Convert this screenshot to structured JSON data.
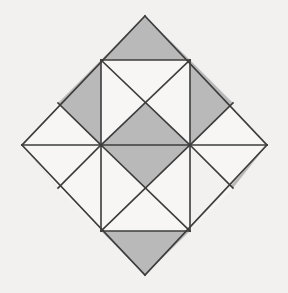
{
  "figure": {
    "type": "geometric-figure",
    "canvas": {
      "width": 288,
      "height": 293
    },
    "background_color": "#f2f1ef",
    "shaded_color": "#b9b9b9",
    "plain_color": "#f7f6f4",
    "stroke_color": "#3c3c3c",
    "stroke_width": 1.6,
    "outline_name": "diamond-outline",
    "vertices": {
      "top": [
        145,
        16
      ],
      "right": [
        267,
        145
      ],
      "bottom": [
        145,
        275
      ],
      "left": [
        22,
        145
      ]
    },
    "grid": {
      "rows": 4,
      "cols": 4,
      "cell_size": 43.5,
      "center": [
        145,
        145
      ],
      "description": "Rotated square divided into a 4x4 array of small squares; several squares are split by diagonals into triangles."
    },
    "shapes": [
      {
        "name": "top-apex-triangle",
        "fill": "shaded",
        "points": "145,16 190,60 101,60"
      },
      {
        "name": "upper-left-outer-triangle",
        "fill": "plain",
        "points": "101,60 58,103 22,145 101,145"
      },
      {
        "name": "upper-left-inner-triangle",
        "fill": "shaded",
        "points": "101,60 101,145 58,103"
      },
      {
        "name": "upper-right-outer-triangle",
        "fill": "plain",
        "points": "190,60 267,145 190,145 233,103"
      },
      {
        "name": "upper-right-inner-triangle",
        "fill": "shaded",
        "points": "190,60 233,103 190,145"
      },
      {
        "name": "center-square-north-triangle",
        "fill": "plain",
        "points": "101,60 190,60 145,103"
      },
      {
        "name": "center-square-west-triangle",
        "fill": "plain",
        "points": "101,60 145,103 101,145"
      },
      {
        "name": "center-square-east-triangle",
        "fill": "plain",
        "points": "190,60 190,145 145,103"
      },
      {
        "name": "center-square-south-triangle",
        "fill": "shaded",
        "points": "101,145 190,145 145,103"
      },
      {
        "name": "lower-left-shaded-triangle",
        "fill": "shaded",
        "points": "22,145 101,145 58,188"
      },
      {
        "name": "lower-left-outer-triangle",
        "fill": "plain",
        "points": "22,145 58,188 101,231 101,145"
      },
      {
        "name": "lower-right-shaded-triangle",
        "fill": "shaded",
        "points": "190,145 267,145 233,188"
      },
      {
        "name": "lower-right-outer-triangle",
        "fill": "plain",
        "points": "190,145 233,188 190,231 267,145"
      },
      {
        "name": "lower-square-north-triangle",
        "fill": "shaded",
        "points": "101,145 190,145 145,188"
      },
      {
        "name": "lower-square-west-triangle",
        "fill": "plain",
        "points": "101,145 145,188 101,231"
      },
      {
        "name": "lower-square-east-triangle",
        "fill": "plain",
        "points": "190,145 190,231 145,188"
      },
      {
        "name": "lower-square-south-triangle",
        "fill": "plain",
        "points": "101,231 190,231 145,188"
      },
      {
        "name": "bottom-apex-triangle",
        "fill": "shaded",
        "points": "101,231 190,231 145,275"
      }
    ],
    "edges": [
      {
        "name": "outline-top-left-edge",
        "x1": 145,
        "y1": 16,
        "x2": 22,
        "y2": 145
      },
      {
        "name": "outline-top-right-edge",
        "x1": 145,
        "y1": 16,
        "x2": 267,
        "y2": 145
      },
      {
        "name": "outline-bottom-left-edge",
        "x1": 22,
        "y1": 145,
        "x2": 145,
        "y2": 275
      },
      {
        "name": "outline-bottom-right-edge",
        "x1": 267,
        "y1": 145,
        "x2": 145,
        "y2": 275
      },
      {
        "name": "horizontal-midline",
        "x1": 22,
        "y1": 145,
        "x2": 267,
        "y2": 145
      },
      {
        "name": "upper-horizontal-line",
        "x1": 101,
        "y1": 60,
        "x2": 190,
        "y2": 60
      },
      {
        "name": "lower-horizontal-line",
        "x1": 101,
        "y1": 231,
        "x2": 190,
        "y2": 231
      },
      {
        "name": "left-vertical-line",
        "x1": 101,
        "y1": 60,
        "x2": 101,
        "y2": 231
      },
      {
        "name": "right-vertical-line",
        "x1": 190,
        "y1": 60,
        "x2": 190,
        "y2": 231
      },
      {
        "name": "center-square-diagonal-nw-se",
        "x1": 101,
        "y1": 60,
        "x2": 190,
        "y2": 145
      },
      {
        "name": "center-square-diagonal-ne-sw",
        "x1": 190,
        "y1": 60,
        "x2": 101,
        "y2": 145
      },
      {
        "name": "lower-square-diagonal-nw-se",
        "x1": 101,
        "y1": 145,
        "x2": 190,
        "y2": 231
      },
      {
        "name": "lower-square-diagonal-ne-sw",
        "x1": 190,
        "y1": 145,
        "x2": 101,
        "y2": 231
      },
      {
        "name": "upper-left-diagonal",
        "x1": 58,
        "y1": 103,
        "x2": 101,
        "y2": 145
      },
      {
        "name": "upper-right-diagonal",
        "x1": 233,
        "y1": 103,
        "x2": 190,
        "y2": 145
      },
      {
        "name": "lower-left-diagonal",
        "x1": 101,
        "y1": 145,
        "x2": 58,
        "y2": 188
      },
      {
        "name": "lower-right-diagonal",
        "x1": 190,
        "y1": 145,
        "x2": 233,
        "y2": 188
      }
    ]
  }
}
